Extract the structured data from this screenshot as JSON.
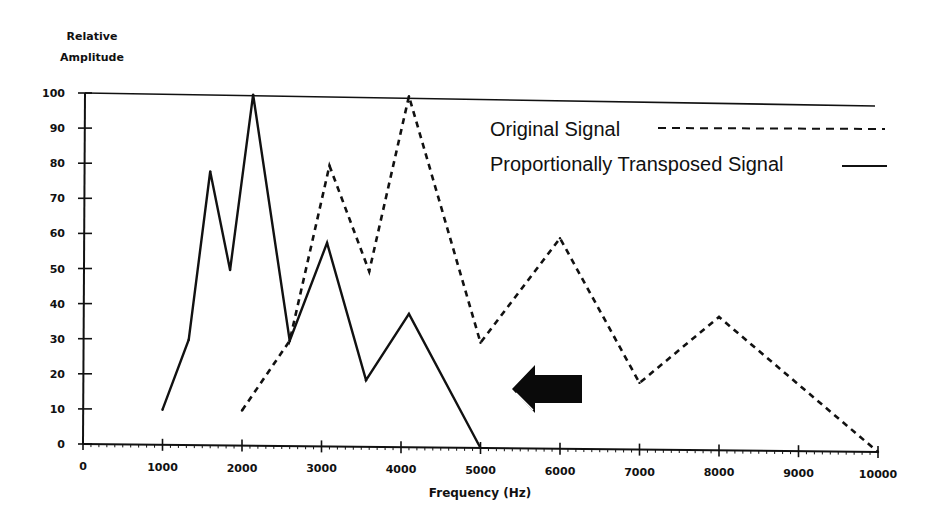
{
  "chart_data": {
    "type": "line",
    "title": "",
    "xlabel": "Frequency (Hz)",
    "ylabel": [
      "Relative",
      "Amplitude"
    ],
    "xlim": [
      0,
      10000
    ],
    "ylim": [
      0,
      100
    ],
    "x_ticks": [
      0,
      1000,
      2000,
      3000,
      4000,
      5000,
      6000,
      7000,
      8000,
      9000,
      10000
    ],
    "x_tick_labels": [
      "0",
      "1000",
      "2000",
      "3000",
      "4000",
      "5000",
      "6000",
      "7000",
      "8000",
      "9000",
      "10000"
    ],
    "y_ticks": [
      0,
      10,
      20,
      30,
      40,
      50,
      60,
      70,
      80,
      90,
      100
    ],
    "y_tick_labels": [
      "0",
      "10",
      "20",
      "30",
      "40",
      "50",
      "60",
      "70",
      "80",
      "90",
      "100"
    ],
    "grid": false,
    "legend_position": "top-right",
    "series": [
      {
        "name": "Original Signal",
        "style": "dashed",
        "x": [
          2000,
          2600,
          3100,
          3600,
          4100,
          5000,
          6000,
          7000,
          8000,
          10000
        ],
        "y": [
          10,
          30,
          80,
          50,
          100,
          30,
          60,
          19,
          38,
          0
        ]
      },
      {
        "name": "Proportionally Transposed Signal",
        "style": "solid",
        "x": [
          1000,
          1330,
          1600,
          1850,
          2140,
          2600,
          3070,
          3560,
          4100,
          5000
        ],
        "y": [
          10,
          30,
          78,
          50,
          100,
          30,
          58,
          19,
          38,
          0
        ]
      }
    ],
    "annotations": [
      {
        "type": "arrow",
        "direction": "left",
        "description": "block arrow indicating downward frequency transposition"
      }
    ]
  }
}
